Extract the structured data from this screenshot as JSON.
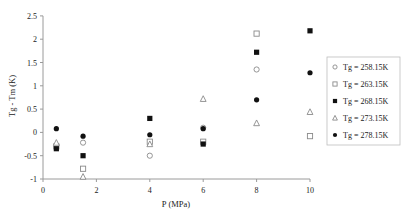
{
  "chart_data": {
    "type": "scatter",
    "title": "",
    "xlabel": "P (MPa)",
    "ylabel": "Tg - Tm (K)",
    "xlim": [
      0,
      10
    ],
    "ylim": [
      -1,
      2.5
    ],
    "xticks": [
      0,
      2,
      4,
      6,
      8,
      10
    ],
    "yticks": [
      -1,
      -0.5,
      0,
      0.5,
      1,
      1.5,
      2,
      2.5
    ],
    "ytick_labels": [
      "-1",
      "-0.5",
      "0",
      "0.5",
      "1",
      "1.5",
      "2",
      "2.5"
    ],
    "grid": false,
    "legend_position": "right",
    "series": [
      {
        "name": "Tg = 258.15K",
        "marker": "open-circle",
        "points": [
          [
            0.5,
            -0.28
          ],
          [
            1.5,
            -0.22
          ],
          [
            4,
            -0.5
          ],
          [
            6,
            0.1
          ],
          [
            8,
            1.35
          ]
        ]
      },
      {
        "name": "Tg = 263.15K",
        "marker": "open-square",
        "points": [
          [
            0.5,
            -0.3
          ],
          [
            1.5,
            -0.78
          ],
          [
            4,
            -0.2
          ],
          [
            6,
            -0.2
          ],
          [
            8,
            2.12
          ],
          [
            10,
            -0.08
          ]
        ]
      },
      {
        "name": "Tg = 268.15K",
        "marker": "filled-square",
        "points": [
          [
            0.5,
            -0.35
          ],
          [
            1.5,
            -0.5
          ],
          [
            4,
            0.3
          ],
          [
            6,
            -0.25
          ],
          [
            8,
            1.72
          ],
          [
            10,
            2.18
          ]
        ]
      },
      {
        "name": "Tg = 273.15K",
        "marker": "open-triangle",
        "points": [
          [
            0.5,
            -0.22
          ],
          [
            1.5,
            -0.95
          ],
          [
            4,
            -0.25
          ],
          [
            6,
            0.72
          ],
          [
            8,
            0.2
          ],
          [
            10,
            0.44
          ]
        ]
      },
      {
        "name": "Tg = 278.15K",
        "marker": "filled-circle",
        "points": [
          [
            0.5,
            0.08
          ],
          [
            1.5,
            -0.08
          ],
          [
            4,
            -0.05
          ],
          [
            6,
            0.08
          ],
          [
            8,
            0.7
          ],
          [
            10,
            1.28
          ]
        ]
      }
    ]
  },
  "legend": {
    "items": [
      {
        "label": "Tg = 258.15K",
        "marker": "open-circle"
      },
      {
        "label": "Tg = 263.15K",
        "marker": "open-square"
      },
      {
        "label": "Tg = 268.15K",
        "marker": "filled-square"
      },
      {
        "label": "Tg = 273.15K",
        "marker": "open-triangle"
      },
      {
        "label": "Tg = 278.15K",
        "marker": "filled-circle"
      }
    ]
  },
  "colors": {
    "axis": "#9a9a9a",
    "marker_filled": "#111111",
    "marker_open_stroke": "#8a8a8a",
    "legend_border": "#bdbdbd",
    "text": "#222222"
  }
}
